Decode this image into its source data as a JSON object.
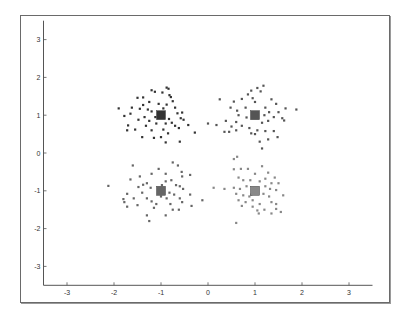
{
  "chart_data": {
    "type": "scatter",
    "title": "",
    "xlabel": "",
    "ylabel": "",
    "xlim": [
      -3.5,
      3.5
    ],
    "ylim": [
      -3.5,
      3.5
    ],
    "grid": false,
    "legend": null,
    "xticks": [
      -3,
      -2,
      -1,
      0,
      1,
      2,
      3
    ],
    "yticks": [
      -3,
      -2,
      -1,
      0,
      1,
      2,
      3
    ],
    "xtick_labels": [
      "-3",
      "-2",
      "-1",
      "0",
      "1",
      "2",
      "3"
    ],
    "ytick_labels": [
      "-3",
      "-2",
      "-1",
      "0",
      "1",
      "2",
      "3"
    ],
    "series": [
      {
        "name": "cluster-1",
        "color": "#333333",
        "centroid": [
          -1.0,
          1.0
        ],
        "points": [
          [
            -1.2,
            1.66
          ],
          [
            -0.88,
            1.73
          ],
          [
            -0.84,
            1.7
          ],
          [
            -1.38,
            1.47
          ],
          [
            -1.5,
            1.46
          ],
          [
            -0.97,
            1.6
          ],
          [
            -1.13,
            1.62
          ],
          [
            -0.82,
            1.53
          ],
          [
            -1.9,
            1.18
          ],
          [
            -1.78,
            0.98
          ],
          [
            -1.65,
            1.04
          ],
          [
            -1.45,
            1.17
          ],
          [
            -1.38,
            1.27
          ],
          [
            -1.28,
            1.15
          ],
          [
            -1.2,
            1.1
          ],
          [
            -1.12,
            0.95
          ],
          [
            -0.95,
            1.18
          ],
          [
            -0.88,
            1.28
          ],
          [
            -0.79,
            1.48
          ],
          [
            -0.75,
            1.37
          ],
          [
            -0.65,
            1.05
          ],
          [
            -0.55,
            1.07
          ],
          [
            -0.58,
            0.92
          ],
          [
            -0.52,
            0.88
          ],
          [
            -0.7,
            0.72
          ],
          [
            -0.62,
            0.66
          ],
          [
            -0.42,
            0.74
          ],
          [
            -0.28,
            0.54
          ],
          [
            -0.6,
            0.3
          ],
          [
            -0.9,
            0.28
          ],
          [
            -1.0,
            0.42
          ],
          [
            -1.15,
            0.4
          ],
          [
            -1.4,
            0.42
          ],
          [
            -1.55,
            0.62
          ],
          [
            -1.72,
            0.6
          ],
          [
            -1.7,
            0.73
          ],
          [
            -1.32,
            0.72
          ],
          [
            -1.25,
            0.85
          ],
          [
            -1.1,
            0.78
          ],
          [
            -0.95,
            0.62
          ],
          [
            -0.85,
            0.52
          ],
          [
            -0.77,
            0.8
          ],
          [
            -0.83,
            0.9
          ],
          [
            -1.05,
            1.3
          ],
          [
            -1.25,
            1.35
          ],
          [
            -1.62,
            1.2
          ],
          [
            -1.35,
            0.95
          ],
          [
            -1.48,
            0.88
          ],
          [
            -0.7,
            1.2
          ],
          [
            -0.9,
            0.78
          ],
          [
            -1.2,
            0.6
          ]
        ]
      },
      {
        "name": "cluster-2",
        "color": "#555555",
        "centroid": [
          1.0,
          1.0
        ],
        "points": [
          [
            1.18,
            1.78
          ],
          [
            1.05,
            1.72
          ],
          [
            0.92,
            1.65
          ],
          [
            1.12,
            1.63
          ],
          [
            0.25,
            1.42
          ],
          [
            0.55,
            1.36
          ],
          [
            0.72,
            1.43
          ],
          [
            0.95,
            1.45
          ],
          [
            1.0,
            1.35
          ],
          [
            1.35,
            1.42
          ],
          [
            1.45,
            1.3
          ],
          [
            1.65,
            1.18
          ],
          [
            1.88,
            1.15
          ],
          [
            0.48,
            1.2
          ],
          [
            0.62,
            1.12
          ],
          [
            0.8,
            1.2
          ],
          [
            1.22,
            1.2
          ],
          [
            1.3,
            1.08
          ],
          [
            1.5,
            1.08
          ],
          [
            1.58,
            0.92
          ],
          [
            1.62,
            0.86
          ],
          [
            1.28,
            0.85
          ],
          [
            1.15,
            0.8
          ],
          [
            0.0,
            0.78
          ],
          [
            0.18,
            0.74
          ],
          [
            0.38,
            0.85
          ],
          [
            0.6,
            0.82
          ],
          [
            0.72,
            0.72
          ],
          [
            0.88,
            0.66
          ],
          [
            1.05,
            0.6
          ],
          [
            1.22,
            0.58
          ],
          [
            1.4,
            0.58
          ],
          [
            1.48,
            0.42
          ],
          [
            1.28,
            0.36
          ],
          [
            1.0,
            0.5
          ],
          [
            0.92,
            0.52
          ],
          [
            0.6,
            0.6
          ],
          [
            0.45,
            0.56
          ],
          [
            0.35,
            0.56
          ],
          [
            1.15,
            0.12
          ],
          [
            0.65,
            1.0
          ],
          [
            0.82,
            0.94
          ],
          [
            1.2,
            1.0
          ],
          [
            1.4,
            0.95
          ],
          [
            0.5,
            0.7
          ],
          [
            1.1,
            0.3
          ],
          [
            0.85,
            1.55
          ]
        ]
      },
      {
        "name": "cluster-3",
        "color": "#666666",
        "centroid": [
          -1.0,
          -1.0
        ],
        "points": [
          [
            -0.75,
            -0.25
          ],
          [
            -0.64,
            -0.33
          ],
          [
            -1.6,
            -0.33
          ],
          [
            -1.05,
            -0.42
          ],
          [
            -1.2,
            -0.55
          ],
          [
            -0.9,
            -0.55
          ],
          [
            -0.56,
            -0.5
          ],
          [
            -0.55,
            -0.62
          ],
          [
            -0.38,
            -0.58
          ],
          [
            -1.45,
            -0.62
          ],
          [
            -1.65,
            -0.7
          ],
          [
            -1.3,
            -0.8
          ],
          [
            -1.38,
            -0.84
          ],
          [
            -1.48,
            -0.9
          ],
          [
            -1.22,
            -0.92
          ],
          [
            -0.9,
            -0.75
          ],
          [
            -0.78,
            -0.72
          ],
          [
            -0.68,
            -0.85
          ],
          [
            -0.6,
            -0.88
          ],
          [
            -0.53,
            -0.95
          ],
          [
            -2.12,
            -0.87
          ],
          [
            -1.72,
            -1.08
          ],
          [
            -1.8,
            -1.22
          ],
          [
            -1.78,
            -1.3
          ],
          [
            -1.72,
            -1.42
          ],
          [
            -1.5,
            -1.38
          ],
          [
            -1.3,
            -1.2
          ],
          [
            -1.2,
            -1.28
          ],
          [
            -1.1,
            -1.35
          ],
          [
            -1.0,
            -1.15
          ],
          [
            -0.88,
            -1.2
          ],
          [
            -0.82,
            -1.05
          ],
          [
            -0.72,
            -1.1
          ],
          [
            -0.6,
            -1.2
          ],
          [
            -0.55,
            -1.3
          ],
          [
            -0.38,
            -1.1
          ],
          [
            -0.35,
            -1.4
          ],
          [
            -0.12,
            -1.25
          ],
          [
            -0.75,
            -1.5
          ],
          [
            -0.62,
            -1.5
          ],
          [
            -0.9,
            -1.65
          ],
          [
            -1.15,
            -1.45
          ],
          [
            -1.3,
            -1.65
          ],
          [
            -1.25,
            -1.8
          ],
          [
            -1.05,
            -0.95
          ],
          [
            -0.95,
            -1.0
          ],
          [
            -1.4,
            -1.05
          ],
          [
            -1.58,
            -1.2
          ],
          [
            -0.8,
            -1.35
          ],
          [
            -0.98,
            -0.85
          ]
        ]
      },
      {
        "name": "cluster-4",
        "color": "#888888",
        "centroid": [
          1.0,
          -1.0
        ],
        "points": [
          [
            0.62,
            -0.1
          ],
          [
            0.55,
            -0.16
          ],
          [
            1.15,
            -0.35
          ],
          [
            0.55,
            -0.43
          ],
          [
            0.7,
            -0.42
          ],
          [
            0.85,
            -0.42
          ],
          [
            1.0,
            -0.55
          ],
          [
            1.28,
            -0.52
          ],
          [
            1.42,
            -0.65
          ],
          [
            0.65,
            -0.65
          ],
          [
            0.75,
            -0.72
          ],
          [
            0.9,
            -0.72
          ],
          [
            1.1,
            -0.75
          ],
          [
            1.35,
            -0.8
          ],
          [
            1.5,
            -0.8
          ],
          [
            0.12,
            -0.92
          ],
          [
            0.35,
            -0.95
          ],
          [
            0.55,
            -0.92
          ],
          [
            0.68,
            -0.95
          ],
          [
            0.82,
            -0.88
          ],
          [
            1.22,
            -0.88
          ],
          [
            1.32,
            -0.95
          ],
          [
            1.45,
            -0.98
          ],
          [
            0.6,
            -1.08
          ],
          [
            0.75,
            -1.12
          ],
          [
            0.92,
            -1.1
          ],
          [
            1.18,
            -1.08
          ],
          [
            1.3,
            -1.15
          ],
          [
            1.6,
            -1.12
          ],
          [
            0.65,
            -1.25
          ],
          [
            0.8,
            -1.3
          ],
          [
            0.95,
            -1.25
          ],
          [
            1.1,
            -1.35
          ],
          [
            1.35,
            -1.3
          ],
          [
            1.45,
            -1.35
          ],
          [
            0.95,
            -1.42
          ],
          [
            1.05,
            -1.52
          ],
          [
            1.2,
            -1.5
          ],
          [
            1.35,
            -1.6
          ],
          [
            1.55,
            -1.56
          ],
          [
            1.45,
            -1.48
          ],
          [
            0.6,
            -1.85
          ],
          [
            1.08,
            -1.6
          ],
          [
            0.88,
            -1.15
          ],
          [
            1.22,
            -0.68
          ],
          [
            0.72,
            -1.4
          ]
        ]
      }
    ]
  }
}
